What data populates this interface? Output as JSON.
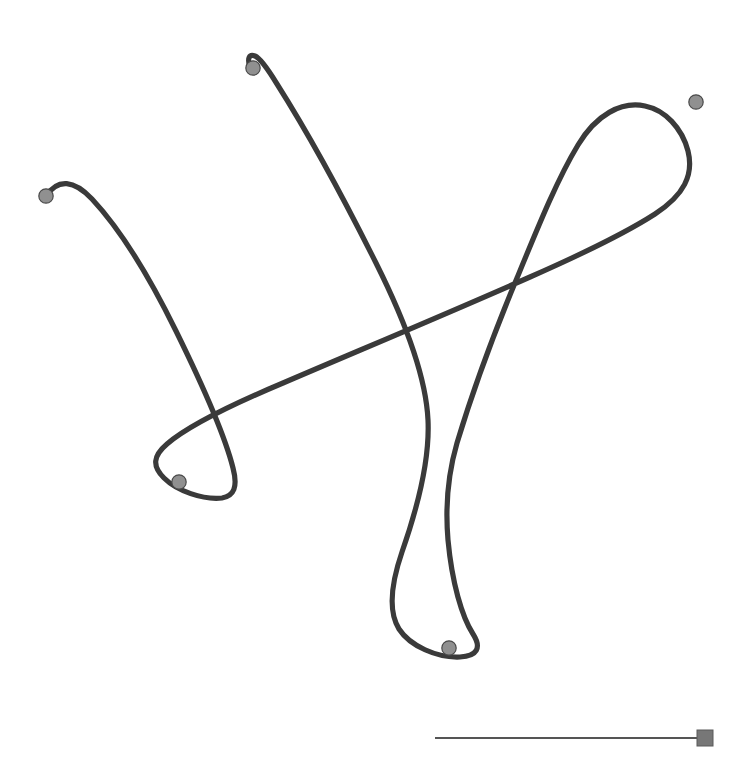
{
  "figure": {
    "width": 745,
    "height": 780,
    "background_color": "#ffffff",
    "type": "trajectory-trace-figure"
  },
  "chart_data": {
    "type": "line",
    "title": "",
    "subtitle": "",
    "xlabel": "",
    "ylabel": "",
    "grid": false,
    "legend": null,
    "axes_visible": false,
    "tick_labels": [],
    "annotations": [],
    "xlim": [
      0,
      745
    ],
    "ylim": [
      0,
      780
    ],
    "series": [
      {
        "name": "trace",
        "stroke_color": "#3a3a3a",
        "stroke_width": 5.2,
        "closed": false,
        "path": "M 46 196 C 58 178 74 180 92 199 C 120 229 150 278 176 331 C 206 392 226 440 233 468 C 238 487 234 496 222 498 C 203 500 177 491 164 478 C 152 466 153 456 167 444 C 189 425 233 404 283 383 C 360 350 451 312 530 277 C 580 255 627 232 655 214 C 684 195 694 175 688 151 C 682 128 665 110 645 106 C 621 101 596 115 578 145 C 558 178 540 222 517 278 C 492 338 470 400 457 443 C 448 474 445 505 448 540 C 452 583 462 617 473 634 C 482 648 477 656 460 657 C 437 658 410 646 399 629 C 389 613 390 587 402 552 C 416 512 430 462 428 420 C 426 377 407 325 376 263 C 341 193 303 125 277 84 C 266 66 260 58 255 56 C 249 54 247 58 250 68"
      }
    ],
    "markers": [
      {
        "id": "node-1",
        "x": 46,
        "y": 196,
        "r": 7.2,
        "fill": "#909090",
        "stroke": "#4a4a4a",
        "label": ""
      },
      {
        "id": "node-2",
        "x": 253,
        "y": 68,
        "r": 7.2,
        "fill": "#909090",
        "stroke": "#4a4a4a",
        "label": ""
      },
      {
        "id": "node-3",
        "x": 696,
        "y": 102,
        "r": 7.2,
        "fill": "#909090",
        "stroke": "#4a4a4a",
        "label": ""
      },
      {
        "id": "node-4",
        "x": 179,
        "y": 482,
        "r": 7.2,
        "fill": "#909090",
        "stroke": "#4a4a4a",
        "label": ""
      },
      {
        "id": "node-5",
        "x": 449,
        "y": 648,
        "r": 7.2,
        "fill": "#909090",
        "stroke": "#4a4a4a",
        "label": ""
      }
    ],
    "crossings": [
      {
        "id": "crossing-left",
        "x": 238,
        "y": 408
      },
      {
        "id": "crossing-center-top",
        "x": 390,
        "y": 320
      },
      {
        "id": "crossing-center-low",
        "x": 444,
        "y": 452
      },
      {
        "id": "crossing-right",
        "x": 553,
        "y": 227
      }
    ],
    "scale_bar": {
      "label": "",
      "x1": 435,
      "x2": 700,
      "y": 738,
      "length_px": 265,
      "stroke_color": "#555555",
      "stroke_width": 2.2,
      "end_square": {
        "x": 697,
        "y": 730,
        "size": 16,
        "fill": "#777777",
        "stroke": "#5a5a5a"
      }
    }
  },
  "colors": {
    "trace": "#3a3a3a",
    "marker_fill": "#909090",
    "marker_stroke": "#4a4a4a",
    "scalebar": "#555555",
    "scalebar_square": "#777777",
    "background": "#ffffff"
  }
}
